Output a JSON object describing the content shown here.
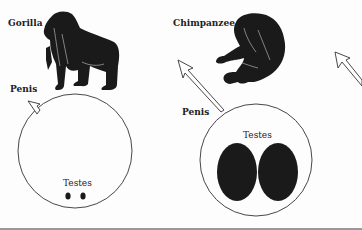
{
  "panels": [
    {
      "id": "gorilla",
      "species_label": "Gorilla",
      "penis_label": "Penis",
      "testes_label": "Testes",
      "testes_size": "small"
    },
    {
      "id": "chimpanzee",
      "species_label": "Chimpanzee",
      "penis_label": "Penis",
      "testes_label": "Testes",
      "testes_size": "large"
    }
  ],
  "colors": {
    "silhouette": "#1a1a1a",
    "outline": "#333333",
    "background": "#fdfdfd",
    "separator": "#999999"
  }
}
